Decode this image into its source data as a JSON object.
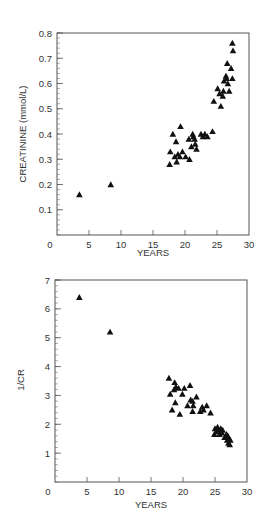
{
  "chart_data": [
    {
      "type": "scatter",
      "title": "",
      "xlabel": "YEARS",
      "ylabel": "CREATININE (mmol/L)",
      "xlim": [
        0,
        30
      ],
      "ylim": [
        0,
        0.8
      ],
      "xticks": [
        0,
        5,
        10,
        15,
        20,
        25,
        30
      ],
      "yticks": [
        0.1,
        0.2,
        0.3,
        0.4,
        0.5,
        0.6,
        0.7,
        0.8
      ],
      "ytick_labels": [
        "0.1",
        "0.2",
        "0.3",
        "0.4",
        "0.5",
        "0.6",
        "0.7",
        "0.8"
      ],
      "xtick_labels": [
        "0",
        "5",
        "10",
        "15",
        "20",
        "25",
        "30"
      ],
      "grid": false,
      "legend": null,
      "marker": "triangle",
      "points": [
        [
          3.5,
          0.16
        ],
        [
          8.4,
          0.2
        ],
        [
          17.6,
          0.28
        ],
        [
          17.7,
          0.33
        ],
        [
          18.1,
          0.4
        ],
        [
          18.4,
          0.31
        ],
        [
          18.6,
          0.37
        ],
        [
          18.7,
          0.29
        ],
        [
          18.9,
          0.32
        ],
        [
          19.2,
          0.31
        ],
        [
          19.3,
          0.43
        ],
        [
          19.6,
          0.33
        ],
        [
          20.1,
          0.31
        ],
        [
          20.6,
          0.38
        ],
        [
          20.7,
          0.3
        ],
        [
          21.0,
          0.35
        ],
        [
          21.2,
          0.4
        ],
        [
          21.3,
          0.39
        ],
        [
          21.5,
          0.38
        ],
        [
          21.6,
          0.36
        ],
        [
          21.8,
          0.34
        ],
        [
          22.5,
          0.4
        ],
        [
          22.8,
          0.39
        ],
        [
          23.1,
          0.4
        ],
        [
          23.5,
          0.39
        ],
        [
          24.3,
          0.41
        ],
        [
          24.5,
          0.53
        ],
        [
          25.1,
          0.58
        ],
        [
          25.4,
          0.56
        ],
        [
          25.6,
          0.51
        ],
        [
          25.9,
          0.55
        ],
        [
          26.0,
          0.57
        ],
        [
          26.1,
          0.61
        ],
        [
          26.4,
          0.63
        ],
        [
          26.5,
          0.62
        ],
        [
          26.6,
          0.68
        ],
        [
          26.7,
          0.6
        ],
        [
          26.9,
          0.57
        ],
        [
          27.2,
          0.66
        ],
        [
          27.4,
          0.62
        ],
        [
          27.4,
          0.76
        ],
        [
          27.5,
          0.73
        ]
      ]
    },
    {
      "type": "scatter",
      "title": "",
      "xlabel": "YEARS",
      "ylabel": "1/CR",
      "xlim": [
        0,
        30
      ],
      "ylim": [
        0,
        7
      ],
      "xticks": [
        0,
        5,
        10,
        15,
        20,
        25,
        30
      ],
      "yticks": [
        1,
        2,
        3,
        4,
        5,
        6,
        7
      ],
      "ytick_labels": [
        "1",
        "2",
        "3",
        "4",
        "5",
        "6",
        "7"
      ],
      "xtick_labels": [
        "0",
        "5",
        "10",
        "15",
        "20",
        "25",
        "30"
      ],
      "grid": false,
      "legend": null,
      "marker": "triangle",
      "points": [
        [
          3.8,
          6.4
        ],
        [
          8.6,
          5.2
        ],
        [
          17.8,
          3.6
        ],
        [
          18.0,
          3.05
        ],
        [
          18.3,
          2.5
        ],
        [
          18.6,
          3.2
        ],
        [
          18.7,
          3.45
        ],
        [
          18.8,
          2.75
        ],
        [
          18.9,
          3.3
        ],
        [
          19.3,
          3.25
        ],
        [
          19.5,
          2.35
        ],
        [
          19.9,
          3.05
        ],
        [
          20.2,
          3.25
        ],
        [
          20.7,
          2.65
        ],
        [
          21.1,
          3.35
        ],
        [
          21.2,
          2.85
        ],
        [
          21.5,
          2.8
        ],
        [
          21.5,
          2.45
        ],
        [
          21.6,
          2.65
        ],
        [
          22.1,
          2.95
        ],
        [
          22.7,
          2.45
        ],
        [
          23.0,
          2.6
        ],
        [
          23.2,
          2.5
        ],
        [
          23.7,
          2.65
        ],
        [
          24.3,
          2.4
        ],
        [
          24.9,
          1.65
        ],
        [
          25.0,
          1.85
        ],
        [
          25.2,
          1.75
        ],
        [
          25.4,
          1.9
        ],
        [
          25.6,
          1.8
        ],
        [
          25.7,
          1.65
        ],
        [
          25.9,
          1.85
        ],
        [
          26.1,
          1.7
        ],
        [
          26.2,
          1.8
        ],
        [
          26.5,
          1.55
        ],
        [
          26.8,
          1.65
        ],
        [
          26.9,
          1.45
        ],
        [
          27.0,
          1.6
        ],
        [
          27.1,
          1.35
        ],
        [
          27.2,
          1.5
        ],
        [
          27.3,
          1.3
        ],
        [
          27.4,
          1.45
        ]
      ]
    }
  ]
}
